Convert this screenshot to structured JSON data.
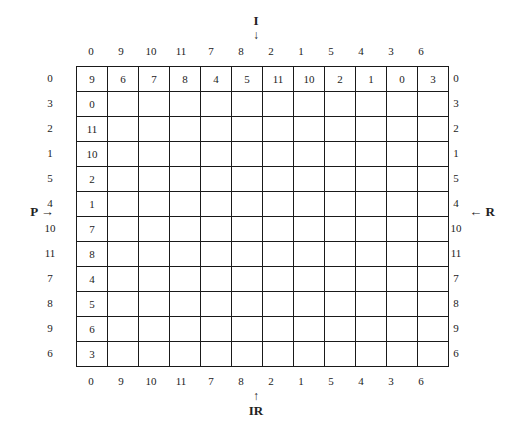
{
  "labels": {
    "top": "I",
    "top_arrow": "↓",
    "bottom": "IR",
    "bottom_arrow": "↑",
    "left": "P →",
    "right": "← R"
  },
  "top_row_labels": [
    "0",
    "9",
    "10",
    "11",
    "7",
    "8",
    "2",
    "1",
    "5",
    "4",
    "3",
    "6"
  ],
  "bottom_row_labels": [
    "0",
    "9",
    "10",
    "11",
    "7",
    "8",
    "2",
    "1",
    "5",
    "4",
    "3",
    "6"
  ],
  "left_col_labels": [
    "0",
    "3",
    "2",
    "1",
    "5",
    "4",
    "10",
    "11",
    "7",
    "8",
    "9",
    "6"
  ],
  "right_col_labels": [
    "0",
    "3",
    "2",
    "1",
    "5",
    "4",
    "10",
    "11",
    "7",
    "8",
    "9",
    "6"
  ],
  "matrix": {
    "first_row": [
      "9",
      "6",
      "7",
      "8",
      "4",
      "5",
      "11",
      "10",
      "2",
      "1",
      "0",
      "3"
    ],
    "first_col": [
      "9",
      "0",
      "11",
      "10",
      "2",
      "1",
      "7",
      "8",
      "4",
      "5",
      "6",
      "3"
    ]
  }
}
